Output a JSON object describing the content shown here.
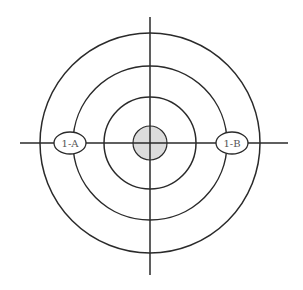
{
  "diagram": {
    "type": "concentric-circles-with-crosshair",
    "center": {
      "x": 150,
      "y": 143
    },
    "colors": {
      "stroke": "#2a2a2a",
      "center_fill": "#dcdcdc",
      "label_fill": "#ffffff",
      "label_text": "#555555",
      "background": "#ffffff"
    },
    "rings": [
      {
        "name": "outer-ring",
        "r": 110
      },
      {
        "name": "middle-ring",
        "r": 77
      },
      {
        "name": "inner-ring",
        "r": 46
      }
    ],
    "center_disc": {
      "r": 17
    },
    "axes": {
      "vertical": {
        "x": 150,
        "y1": 17,
        "y2": 275
      },
      "horizontal": {
        "y": 143,
        "x1": 20,
        "x2": 288
      }
    },
    "labels": [
      {
        "id": "1-A",
        "text": "1-A",
        "cx": 70,
        "cy": 143,
        "rx": 16,
        "ry": 11
      },
      {
        "id": "1-B",
        "text": "1-B",
        "cx": 232,
        "cy": 143,
        "rx": 16,
        "ry": 11
      }
    ]
  }
}
